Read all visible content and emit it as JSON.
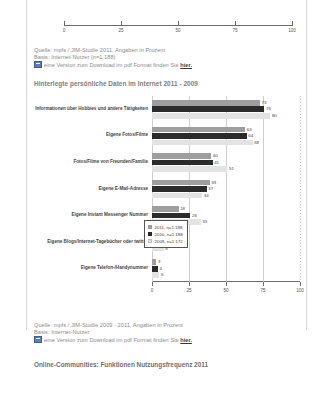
{
  "top_axis": {
    "ticks": [
      0,
      25,
      50,
      75,
      100
    ],
    "labels": [
      "0",
      "25",
      "50",
      "75",
      "100"
    ]
  },
  "source_top": {
    "line1": "Quelle: mpfs / JIM-Studie 2011, Angaben in Prozent",
    "line2": "Basis: Internet-Nutzer (n=1.188)",
    "line3_pre": "eine Version zum Download im pdf Format finden Sie ",
    "link": "hier.",
    "icon": "pdf-icon"
  },
  "source_bottom": {
    "line1": "Quelle: mpfs / JIM-Studie 2009 - 2011, Angaben in Prozent",
    "line2": "Basis: Internet-Nutzer",
    "line3_pre": "eine Version zum Download im pdf Format finden Sie ",
    "link": "hier.",
    "icon": "pdf-icon"
  },
  "next_section": {
    "heading": "Online-Communities: Funktionen Nutzungsfrequenz 2011"
  },
  "chart_data": {
    "type": "bar",
    "orientation": "horizontal",
    "title": "Hinterlegte persönliche Daten im Internet 2011 - 2009",
    "xlabel": "",
    "ylabel": "",
    "xlim": [
      0,
      100
    ],
    "xticks": [
      0,
      25,
      50,
      75,
      100
    ],
    "xticklabels": [
      "0",
      "25",
      "50",
      "75",
      "100"
    ],
    "grid": true,
    "legend_position": "right-inside",
    "categories": [
      "Informationen über Hobbies und andere Tätigkeiten",
      "Eigene Fotos/Filme",
      "Fotos/Filme von Freunden/Familie",
      "Eigene E-Mail-Adresse",
      "Eigene Instant Messenger Nummer",
      "Eigene Blogs/Internet-Tagebücher oder twitter",
      "Eigene Telefon-/Handynummer"
    ],
    "series": [
      {
        "name": "2011, n=1.188",
        "color": "#9e9e9e",
        "values": [
          73,
          63,
          40,
          39,
          18,
          5,
          3
        ]
      },
      {
        "name": "2010, n=1.188",
        "color": "#2b2b2b",
        "values": [
          76,
          64,
          41,
          37,
          26,
          7,
          4
        ]
      },
      {
        "name": "2009, n=1.172",
        "color": "#e3e3e3",
        "values": [
          80,
          68,
          51,
          34,
          33,
          8,
          5
        ]
      }
    ]
  }
}
